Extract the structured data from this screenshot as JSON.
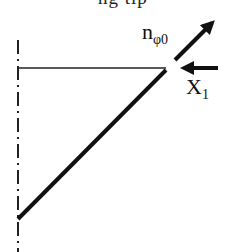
{
  "caption_clipped": "ng tip",
  "labels": {
    "normal_vector": {
      "base": "n",
      "sub": "φ0"
    },
    "force": {
      "base": "X",
      "sub": "1"
    }
  },
  "colors": {
    "stroke": "#111111",
    "background": "#ffffff"
  }
}
